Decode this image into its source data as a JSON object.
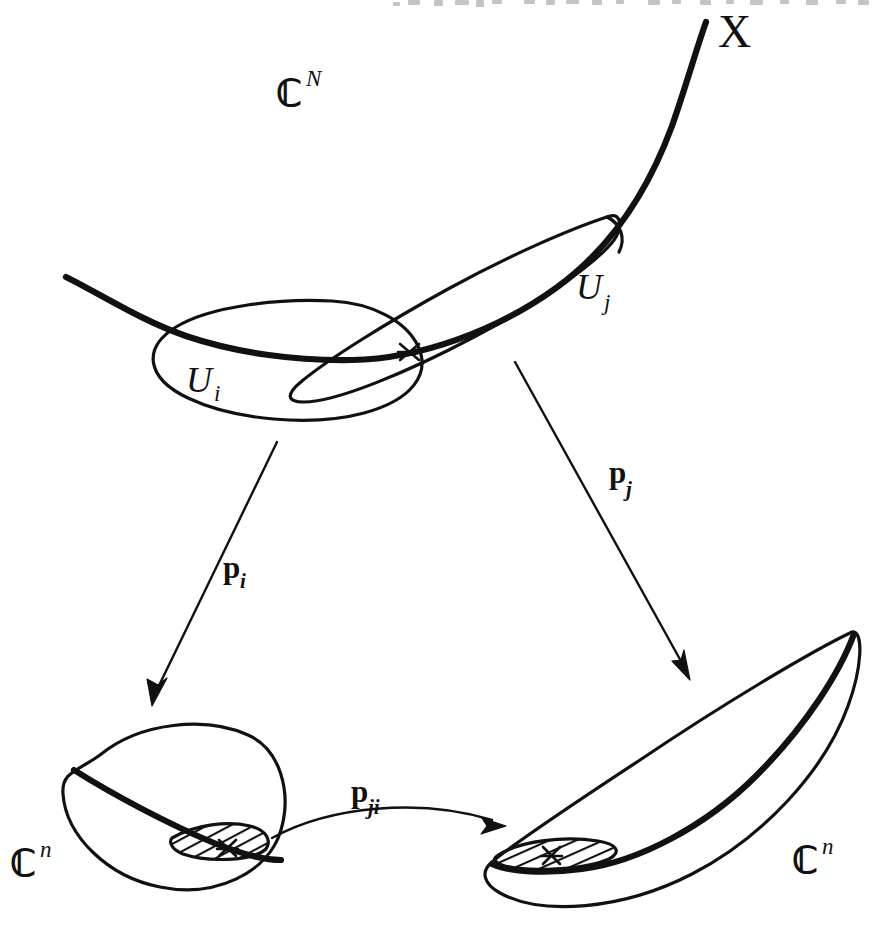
{
  "figure": {
    "kind": "hand-drawn-math-diagram",
    "background_color": "#ffffff",
    "ink_color": "#111111",
    "width": 887,
    "height": 932
  },
  "labels": {
    "ambient_space": {
      "base": "ℂ",
      "sup": "N",
      "text": "ℂᴺ"
    },
    "manifold": {
      "text": "X"
    },
    "chart_i": {
      "base": "U",
      "sub": "i",
      "text": "Uᵢ"
    },
    "chart_j": {
      "base": "U",
      "sub": "j",
      "text": "Uⱼ"
    },
    "map_i": {
      "base": "p",
      "sub": "i",
      "text": "pᵢ"
    },
    "map_j": {
      "base": "p",
      "sub": "j",
      "text": "pⱼ"
    },
    "transition_map": {
      "base": "p",
      "sub": "ji",
      "text": "pⱼᵢ"
    },
    "target_left": {
      "base": "ℂ",
      "sup": "n",
      "text": "ℂⁿ"
    },
    "target_right": {
      "base": "ℂ",
      "sup": "n",
      "text": "ℂⁿ"
    }
  },
  "elements": {
    "curve_X": "thick hand-drawn curve running from lower-left, through both chart ellipses, sweeping up to the top-right where it is labelled X",
    "ellipse_Ui": "rounded ellipse on the left, tilted slightly, labelled U_i",
    "lens_Uj": "long narrow lens / crescent tilted about -30 degrees on the right, labelled U_j",
    "intersection_marker": "small x at the overlap of U_i and U_j on the curve X",
    "arrow_pi": "straight arrow from U_i down-left to the left C^n blob, labelled p_i",
    "arrow_pj": "straight arrow from U_j down-right to the right C^n blob, labelled p_j",
    "arrow_pji": "gently curved arrow between the two lower blobs pointing right, labelled p_ji",
    "blob_left": "oval disc with a thick chord; a hatched lens sits on the chord with an x mark; labelled C^n",
    "blob_right": "large crescent / lens shaped disc with a thick chord; hatched lens with an x mark at its left end; labelled C^n",
    "hatched_region_left": "diagonally hatched lens = image p_i(U_i n U_j)",
    "hatched_region_right": "diagonally hatched lens = image p_j(U_i n U_j)"
  },
  "page_artifact": {
    "description": "bottom sliver of a line of body text cropped at the very top edge of the scan",
    "visible": true
  }
}
